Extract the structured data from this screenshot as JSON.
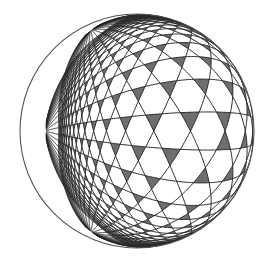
{
  "figure": {
    "width": 267,
    "height": 264,
    "background": "#ffffff",
    "sphere": {
      "cx": 137,
      "cy": 131,
      "r": 117,
      "outline_color": "#555555",
      "outline_width": 1.1
    },
    "lattice": {
      "type": "kagome",
      "line_families_deg": [
        0,
        60,
        120
      ],
      "spacing": 0.33,
      "range": 14,
      "line_color": "#2b2b2b",
      "line_width": 1.0,
      "triangle_fill": "#6e6e6e",
      "hexagon_fill": "#ffffff"
    },
    "view": {
      "rotate_y_deg": 38,
      "rotate_x_deg": 0,
      "rotate_z_deg": 0,
      "shift_u": 0.0,
      "shift_v": 0.0
    }
  }
}
